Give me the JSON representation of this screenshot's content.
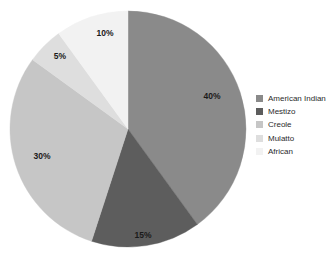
{
  "chart_data": {
    "type": "pie",
    "title": "",
    "subtitle": "",
    "xlabel": "",
    "ylabel": "",
    "grid": false,
    "legend_position": "right",
    "start_angle_deg": 0,
    "direction": "clockwise",
    "categories": [
      "American Indian",
      "Mestizo",
      "Creole",
      "Mulatto",
      "African"
    ],
    "values": [
      40,
      15,
      30,
      5,
      10
    ],
    "value_unit": "%",
    "colors": [
      "#8a8a8a",
      "#5d5d5d",
      "#c6c6c6",
      "#dedede",
      "#f2f2f2"
    ],
    "slices": [
      {
        "label": "American Indian",
        "value": 40,
        "data_label": "40%",
        "color": "#8a8a8a",
        "start_deg": 0,
        "end_deg": 144,
        "label_x": 212,
        "label_y": 97
      },
      {
        "label": "Mestizo",
        "value": 15,
        "data_label": "15%",
        "color": "#5d5d5d",
        "start_deg": 144,
        "end_deg": 198,
        "label_x": 143,
        "label_y": 236
      },
      {
        "label": "Creole",
        "value": 30,
        "data_label": "30%",
        "color": "#c6c6c6",
        "start_deg": 198,
        "end_deg": 306,
        "label_x": 42,
        "label_y": 157
      },
      {
        "label": "Mulatto",
        "value": 5,
        "data_label": "5%",
        "color": "#dedede",
        "start_deg": 306,
        "end_deg": 324,
        "label_x": 60,
        "label_y": 57
      },
      {
        "label": "African",
        "value": 10,
        "data_label": "10%",
        "color": "#f2f2f2",
        "start_deg": 324,
        "end_deg": 360,
        "label_x": 105,
        "label_y": 34
      }
    ],
    "geometry": {
      "center_x": 128,
      "center_y": 129,
      "radius": 118
    }
  },
  "legend": {
    "items": [
      {
        "label": "American Indian",
        "color": "#8a8a8a"
      },
      {
        "label": "Mestizo",
        "color": "#5d5d5d"
      },
      {
        "label": "Creole",
        "color": "#c6c6c6"
      },
      {
        "label": "Mulatto",
        "color": "#dedede"
      },
      {
        "label": "African",
        "color": "#f2f2f2"
      }
    ]
  },
  "background_color": "#ffffff"
}
